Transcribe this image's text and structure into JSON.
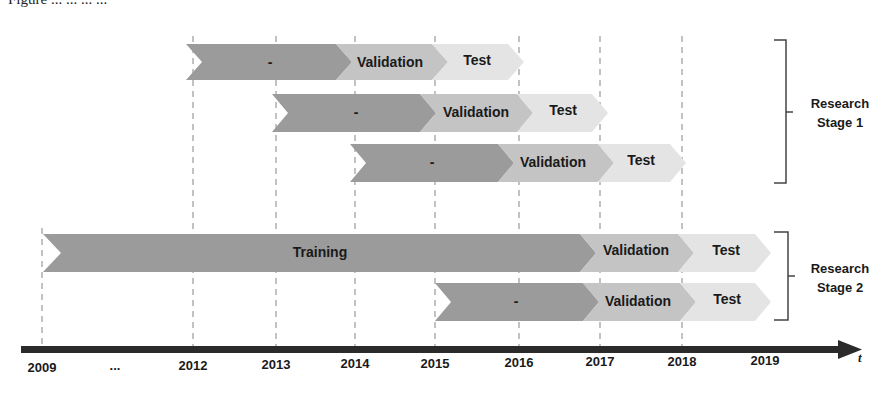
{
  "caption": "Figure ... ... ... ...",
  "colors": {
    "training": "#9b9b9b",
    "validation": "#c4c4c4",
    "test": "#e4e4e4",
    "axis": "#2b2b2b",
    "gridline": "#9a9a9a"
  },
  "axis": {
    "variable": "t",
    "ticks": [
      {
        "label": "2009",
        "x": 42
      },
      {
        "label": "...",
        "x": 115
      },
      {
        "label": "2012",
        "x": 193
      },
      {
        "label": "2013",
        "x": 276
      },
      {
        "label": "2014",
        "x": 355
      },
      {
        "label": "2015",
        "x": 435
      },
      {
        "label": "2016",
        "x": 519
      },
      {
        "label": "2017",
        "x": 600
      },
      {
        "label": "2018",
        "x": 682
      },
      {
        "label": "2019",
        "x": 765
      }
    ]
  },
  "stages": [
    {
      "label_line1": "Research",
      "label_line2": "Stage 1",
      "rows": [
        {
          "segments": [
            {
              "type": "training",
              "label": "-",
              "start": "2012",
              "end": "2014"
            },
            {
              "type": "validation",
              "label": "Validation",
              "start": "2014",
              "end": "2015"
            },
            {
              "type": "test",
              "label": "Test",
              "start": "2015",
              "end": "2016"
            }
          ]
        },
        {
          "segments": [
            {
              "type": "training",
              "label": "-",
              "start": "2013",
              "end": "2015"
            },
            {
              "type": "validation",
              "label": "Validation",
              "start": "2015",
              "end": "2016"
            },
            {
              "type": "test",
              "label": "Test",
              "start": "2016",
              "end": "2017"
            }
          ]
        },
        {
          "segments": [
            {
              "type": "training",
              "label": "-",
              "start": "2014",
              "end": "2016"
            },
            {
              "type": "validation",
              "label": "Validation",
              "start": "2016",
              "end": "2017"
            },
            {
              "type": "test",
              "label": "Test",
              "start": "2017",
              "end": "2018"
            }
          ]
        }
      ]
    },
    {
      "label_line1": "Research",
      "label_line2": "Stage 2",
      "rows": [
        {
          "segments": [
            {
              "type": "training",
              "label": "Training",
              "start": "2009",
              "end": "2017"
            },
            {
              "type": "validation",
              "label": "Validation",
              "start": "2017",
              "end": "2018"
            },
            {
              "type": "test",
              "label": "Test",
              "start": "2018",
              "end": "2019"
            }
          ]
        },
        {
          "segments": [
            {
              "type": "training",
              "label": "-",
              "start": "2015",
              "end": "2017"
            },
            {
              "type": "validation",
              "label": "Validation",
              "start": "2017",
              "end": "2018"
            },
            {
              "type": "test",
              "label": "Test",
              "start": "2018",
              "end": "2019"
            }
          ]
        }
      ]
    }
  ]
}
